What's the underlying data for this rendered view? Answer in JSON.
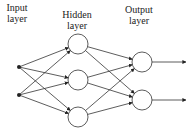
{
  "diagram": {
    "colors": {
      "stroke": "#333333",
      "node_fill": "#ffffff",
      "text": "#222222",
      "background": "#ffffff"
    },
    "layers": [
      {
        "id": "input",
        "label_line1": "Input",
        "label_line2": "layer",
        "label_x": 17,
        "label_y": 2
      },
      {
        "id": "hidden",
        "label_line1": "Hidden",
        "label_line2": "layer",
        "label_x": 77,
        "label_y": 9
      },
      {
        "id": "output",
        "label_line1": "Output",
        "label_line2": "layer",
        "label_x": 139,
        "label_y": 4
      }
    ],
    "nodes": {
      "input": [
        {
          "x": 19,
          "y": 67
        },
        {
          "x": 19,
          "y": 95
        }
      ],
      "hidden": [
        {
          "x": 78,
          "y": 44
        },
        {
          "x": 78,
          "y": 80
        },
        {
          "x": 78,
          "y": 117
        }
      ],
      "output": [
        {
          "x": 142,
          "y": 62
        },
        {
          "x": 142,
          "y": 100
        }
      ]
    },
    "node_radius": 10,
    "input_dot_radius": 2,
    "output_arrow_end_x": 186
  }
}
